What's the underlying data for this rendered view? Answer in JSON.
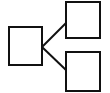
{
  "diagram": {
    "type": "tree-hierarchy",
    "background": "#ffffff",
    "stroke_color": "#111111",
    "stroke_width": 2,
    "nodes": [
      {
        "id": "root",
        "x": 9,
        "y": 27,
        "w": 33,
        "h": 38
      },
      {
        "id": "child-top",
        "x": 66,
        "y": 2,
        "w": 34,
        "h": 36
      },
      {
        "id": "child-bottom",
        "x": 66,
        "y": 52,
        "w": 34,
        "h": 39
      }
    ],
    "edges": [
      {
        "from": "root",
        "to": "child-top",
        "x1": 42,
        "y1": 47,
        "x2": 66,
        "y2": 23
      },
      {
        "from": "root",
        "to": "child-bottom",
        "x1": 42,
        "y1": 47,
        "x2": 66,
        "y2": 70
      }
    ]
  }
}
